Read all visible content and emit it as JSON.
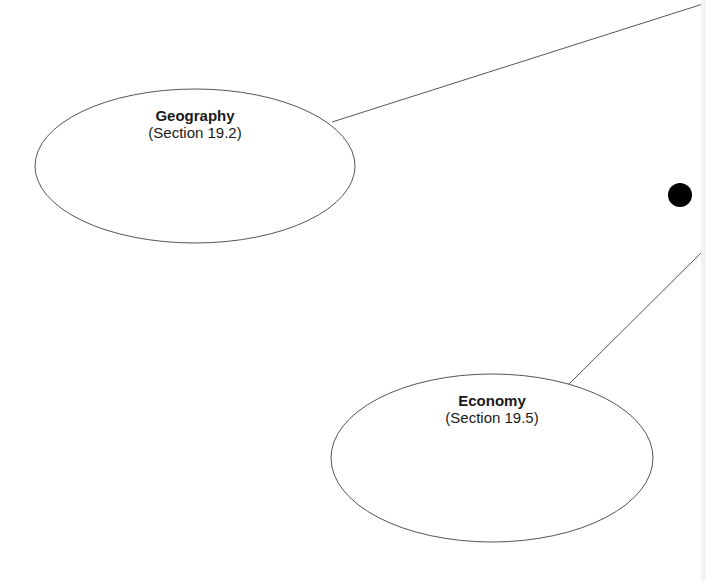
{
  "diagram": {
    "background": "#ffffff",
    "stroke_color": "#555555",
    "dot_color": "#000000",
    "nodes": [
      {
        "id": "geography",
        "title": "Geography",
        "subtitle": "(Section 19.2)",
        "shape": "ellipse",
        "cx": 195,
        "cy": 166,
        "rx": 160,
        "ry": 77
      },
      {
        "id": "economy",
        "title": "Economy",
        "subtitle": "(Section 19.5)",
        "shape": "ellipse",
        "cx": 492,
        "cy": 458,
        "rx": 161,
        "ry": 84
      }
    ],
    "connectors": [
      {
        "from": "geography",
        "to": "offscreen-right-top",
        "x1": 332,
        "y1": 122,
        "x2": 706,
        "y2": 3
      },
      {
        "from": "economy",
        "to": "offscreen-right-middle",
        "x1": 569,
        "y1": 384,
        "x2": 706,
        "y2": 248
      }
    ],
    "bullet": {
      "cx": 680,
      "cy": 195,
      "r": 12
    }
  }
}
